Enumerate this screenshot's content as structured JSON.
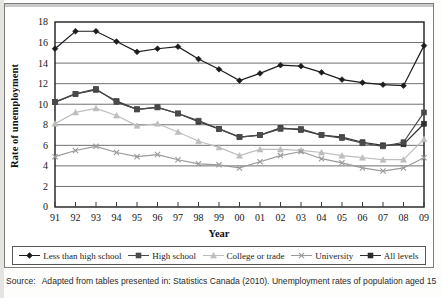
{
  "figure": {
    "source_label": "Source:",
    "source_text": "Adapted from tables presented in: Statistics Canada (2010). Unemployment rates of population aged 15"
  },
  "chart_data": {
    "type": "line",
    "title": "",
    "xlabel": "Year",
    "ylabel": "Rate of unemployment",
    "xlim": [
      0,
      18
    ],
    "ylim": [
      0,
      18
    ],
    "ytick_step": 2,
    "grid": "horizontal",
    "legend_position": "bottom",
    "categories": [
      "91",
      "92",
      "93",
      "94",
      "95",
      "96",
      "97",
      "98",
      "99",
      "00",
      "01",
      "02",
      "03",
      "04",
      "05",
      "06",
      "07",
      "08",
      "09"
    ],
    "yticks": [
      "0",
      "2",
      "4",
      "6",
      "8",
      "10",
      "12",
      "14",
      "16",
      "18"
    ],
    "series": [
      {
        "name": "Less than high school",
        "marker": "diamond",
        "color": "#1c1c1c",
        "values": [
          15.4,
          17.1,
          17.1,
          16.1,
          15.1,
          15.4,
          15.6,
          14.4,
          13.4,
          12.3,
          13.0,
          13.8,
          13.7,
          13.1,
          12.4,
          12.1,
          11.9,
          11.8,
          15.7
        ]
      },
      {
        "name": "High school",
        "marker": "square",
        "color": "#4a4a4a",
        "values": [
          10.2,
          11.0,
          11.5,
          10.2,
          9.5,
          9.7,
          9.1,
          8.4,
          7.6,
          6.8,
          7.0,
          7.6,
          7.6,
          7.0,
          6.7,
          6.2,
          5.9,
          6.3,
          9.2
        ]
      },
      {
        "name": "College or trade",
        "marker": "triangle",
        "color": "#bdbdbd",
        "values": [
          8.1,
          9.2,
          9.6,
          8.9,
          7.9,
          8.1,
          7.3,
          6.4,
          5.8,
          5.0,
          5.6,
          5.6,
          5.5,
          5.3,
          5.0,
          4.8,
          4.6,
          4.6,
          6.6
        ]
      },
      {
        "name": "University",
        "marker": "x",
        "color": "#9a9a9a",
        "values": [
          4.9,
          5.5,
          5.9,
          5.3,
          4.9,
          5.1,
          4.6,
          4.2,
          4.1,
          3.8,
          4.4,
          5.0,
          5.4,
          4.7,
          4.3,
          3.8,
          3.5,
          3.8,
          4.8
        ]
      },
      {
        "name": "All levels",
        "marker": "square",
        "color": "#2e2e2e",
        "values": [
          10.2,
          11.0,
          11.4,
          10.3,
          9.5,
          9.7,
          9.1,
          8.3,
          7.6,
          6.8,
          7.0,
          7.7,
          7.5,
          7.0,
          6.8,
          6.3,
          6.0,
          6.1,
          8.1
        ]
      }
    ]
  }
}
